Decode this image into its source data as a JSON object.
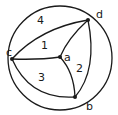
{
  "diagram": {
    "type": "planar-graph-in-circle",
    "vertices": [
      {
        "id": "a",
        "label": "a"
      },
      {
        "id": "b",
        "label": "b"
      },
      {
        "id": "c",
        "label": "c"
      },
      {
        "id": "d",
        "label": "d"
      }
    ],
    "regions": [
      {
        "id": "r1",
        "label": "1"
      },
      {
        "id": "r2",
        "label": "2"
      },
      {
        "id": "r3",
        "label": "3"
      },
      {
        "id": "r4",
        "label": "4"
      }
    ],
    "edges": [
      [
        "a",
        "c"
      ],
      [
        "a",
        "d"
      ],
      [
        "a",
        "b"
      ],
      [
        "c",
        "d"
      ],
      [
        "d",
        "b"
      ],
      [
        "b",
        "c"
      ]
    ],
    "colors": {
      "stroke": "#1a1a1a",
      "background": "#ffffff"
    }
  }
}
